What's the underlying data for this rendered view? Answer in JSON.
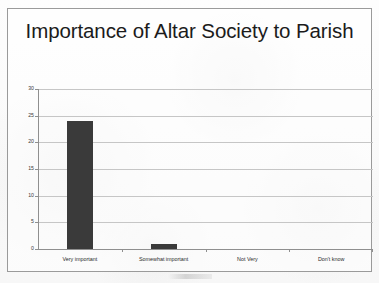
{
  "chart_data": {
    "type": "bar",
    "title": "Importance of Altar Society to Parish",
    "xlabel": "",
    "ylabel": "",
    "categories": [
      "Very important",
      "Somewhat important",
      "Not Very",
      "Don't know"
    ],
    "values": [
      24,
      1,
      0,
      0
    ],
    "ylim": [
      0,
      30
    ],
    "yticks": [
      0,
      5,
      10,
      15,
      20,
      25,
      30
    ],
    "ytick_labels": [
      "0",
      "5",
      "10",
      "15",
      "20",
      "25",
      "30"
    ],
    "grid": true,
    "legend": null,
    "series": [
      {
        "name": "Responses",
        "values": [
          24,
          1,
          0,
          0
        ],
        "color": "#3a3a3a"
      }
    ],
    "colors": {
      "bar": "#3a3a3a",
      "gridline": "#c6c6c6",
      "axis": "#8f8f8f",
      "frame": "#9a9a9a",
      "title_text": "#1b1b1b",
      "tick_text": "#3a3a3a",
      "background": "#fbfbfb"
    }
  }
}
